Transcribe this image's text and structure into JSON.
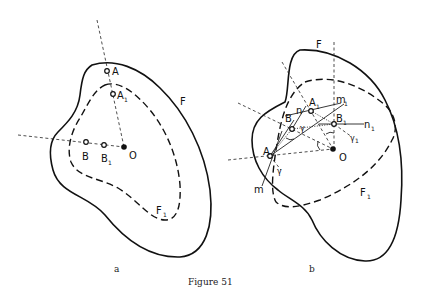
{
  "caption": "Figure 51",
  "figure_a": {
    "sublabel": "a",
    "curve_outer_label": "F",
    "curve_inner_label": "F",
    "curve_inner_sub": "1",
    "points": {
      "A": {
        "label": "A"
      },
      "A1": {
        "label": "A",
        "sub": "1"
      },
      "B": {
        "label": "B"
      },
      "B1": {
        "label": "B",
        "sub": "1"
      },
      "O": {
        "label": "O"
      }
    }
  },
  "figure_b": {
    "sublabel": "b",
    "curve_outer_label": "F",
    "curve_inner_label": "F",
    "curve_inner_sub": "1",
    "points": {
      "A": {
        "label": "A"
      },
      "A1": {
        "label": "A",
        "sub": "1"
      },
      "B": {
        "label": "B"
      },
      "B1": {
        "label": "B",
        "sub": "1"
      },
      "O": {
        "label": "O"
      }
    },
    "lines": {
      "m": {
        "label": "m"
      },
      "m1": {
        "label": "m",
        "sub": "1"
      },
      "n": {
        "label": "n"
      },
      "n1": {
        "label": "n",
        "sub": "1"
      }
    },
    "angles": {
      "gamma": {
        "label": "γ"
      },
      "gamma1": {
        "label": "γ",
        "sub": "1"
      }
    }
  }
}
